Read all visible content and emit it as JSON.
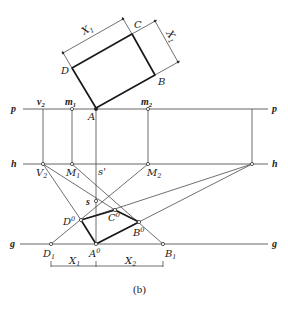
{
  "figure": {
    "caption": "(b)",
    "lines": {
      "p": "p",
      "h": "h",
      "g": "g"
    },
    "rectangle": {
      "A": "A",
      "B": "B",
      "C": "C",
      "D": "D",
      "dim_top": {
        "base": "X",
        "sub": "1"
      },
      "dim_right": {
        "base": "X",
        "sub": "1"
      }
    },
    "p_points": {
      "v2": {
        "base": "v",
        "sub": "2"
      },
      "m1": {
        "base": "m",
        "sub": "1"
      },
      "m2": {
        "base": "m",
        "sub": "2"
      },
      "A": "A"
    },
    "h_points": {
      "V2": {
        "base": "V",
        "sub": "2"
      },
      "M1": {
        "base": "M",
        "sub": "1"
      },
      "s_prime": "s'",
      "M2": {
        "base": "M",
        "sub": "2"
      }
    },
    "construction_points": {
      "s": "s",
      "D0": {
        "base": "D",
        "sup": "0"
      },
      "C0": {
        "base": "C",
        "sup": "0"
      },
      "B0": {
        "base": "B",
        "sup": "0"
      }
    },
    "g_points": {
      "D1": {
        "base": "D",
        "sub": "1"
      },
      "A0": {
        "base": "A",
        "sup": "0"
      },
      "B1": {
        "base": "B",
        "sub": "1"
      }
    },
    "bottom_dims": {
      "X1": {
        "base": "X",
        "sub": "1"
      },
      "X2": {
        "base": "X",
        "sub": "2"
      }
    }
  }
}
